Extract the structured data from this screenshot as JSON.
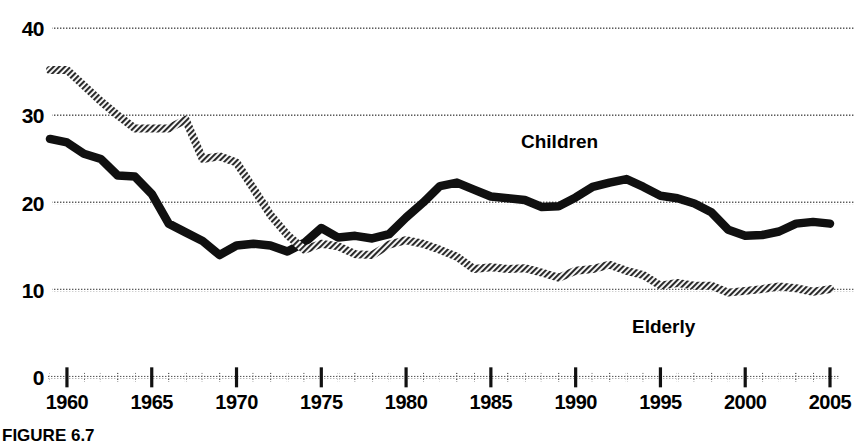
{
  "figure": {
    "caption": "FIGURE 6.7"
  },
  "labels": {
    "children": "Children",
    "elderly": "Elderly"
  },
  "chart_data": {
    "type": "line",
    "title": "",
    "subtitle": "",
    "xlabel": "",
    "ylabel": "",
    "xlim": [
      1959,
      2005
    ],
    "ylim": [
      0,
      40
    ],
    "yticks": [
      0,
      10,
      20,
      30,
      40
    ],
    "ytick_labels": [
      "0",
      "10",
      "20",
      "30",
      "40"
    ],
    "xticks": [
      1960,
      1965,
      1970,
      1975,
      1980,
      1985,
      1990,
      1995,
      2000,
      2005
    ],
    "xtick_labels": [
      "1960",
      "1965",
      "1970",
      "1975",
      "1980",
      "1985",
      "1990",
      "1995",
      "2000",
      "2005"
    ],
    "x_minor_tick_interval": 1,
    "grid": "horizontal-dotted",
    "gridlines": [
      10,
      20,
      30,
      40
    ],
    "legend": "inline-annotations",
    "colors": {
      "children": "#101010",
      "elderly": "#6b6b6b",
      "gridline": "#555555",
      "axis": "#000000"
    },
    "x": [
      1959,
      1960,
      1961,
      1962,
      1963,
      1964,
      1965,
      1966,
      1967,
      1968,
      1969,
      1970,
      1971,
      1972,
      1973,
      1974,
      1975,
      1976,
      1977,
      1978,
      1979,
      1980,
      1981,
      1982,
      1983,
      1984,
      1985,
      1986,
      1987,
      1988,
      1989,
      1990,
      1991,
      1992,
      1993,
      1994,
      1995,
      1996,
      1997,
      1998,
      1999,
      2000,
      2001,
      2002,
      2003,
      2004,
      2005
    ],
    "series": [
      {
        "name": "Children",
        "style": "thick-solid-black",
        "values": [
          27.3,
          26.9,
          25.6,
          25.0,
          23.1,
          23.0,
          21.0,
          17.6,
          16.6,
          15.6,
          14.0,
          15.1,
          15.3,
          15.1,
          14.4,
          15.4,
          17.1,
          16.0,
          16.2,
          15.9,
          16.4,
          18.3,
          20.0,
          21.9,
          22.3,
          21.5,
          20.7,
          20.5,
          20.3,
          19.5,
          19.6,
          20.6,
          21.8,
          22.3,
          22.7,
          21.8,
          20.8,
          20.5,
          19.9,
          18.9,
          16.9,
          16.2,
          16.3,
          16.7,
          17.6,
          17.8,
          17.6
        ],
        "label": "Children"
      },
      {
        "name": "Elderly",
        "style": "thick-hatched-gray",
        "values": [
          35.2,
          35.2,
          33.4,
          31.6,
          30.0,
          28.5,
          28.5,
          28.5,
          29.5,
          25.0,
          25.3,
          24.6,
          21.6,
          18.6,
          16.3,
          14.6,
          15.3,
          15.0,
          14.1,
          14.0,
          15.2,
          15.7,
          15.3,
          14.6,
          13.8,
          12.4,
          12.6,
          12.4,
          12.5,
          12.0,
          11.4,
          12.2,
          12.4,
          12.9,
          12.2,
          11.7,
          10.5,
          10.8,
          10.5,
          10.5,
          9.7,
          9.9,
          10.1,
          10.4,
          10.2,
          9.8,
          10.1
        ],
        "label": "Elderly"
      }
    ]
  }
}
